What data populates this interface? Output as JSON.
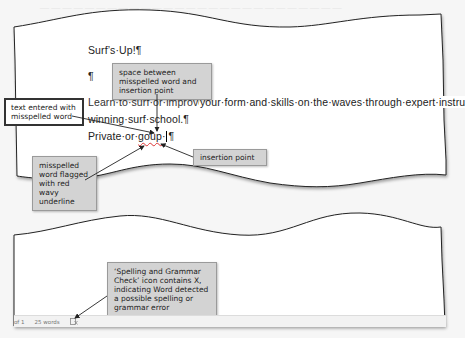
{
  "document": {
    "lines": [
      {
        "id": "title",
        "text": "Surf’s·Up!¶"
      },
      {
        "id": "blank",
        "text": "¶"
      },
      {
        "id": "para1_start",
        "text": "Learn·to·surf·or·improve·"
      },
      {
        "id": "para1_visible",
        "text": "your·form·and·skills·on·the·waves·through·expert·instru"
      },
      {
        "id": "para1_line2",
        "text": "winning·surf·school.¶"
      }
    ],
    "line4": {
      "prefix": "Private·or·",
      "misspelled_word": "goup",
      "after_space": "·",
      "pilcrow": "¶"
    },
    "misspelled_underline_color": "#d33333"
  },
  "status_bar": {
    "page_info": "of 1",
    "word_count": "25 words",
    "spell_icon": "spelling-grammar-check-icon-with-x"
  },
  "callouts": {
    "space_between": "space between misspelled word and insertion point",
    "text_entered": "text entered with misspelled word",
    "misspelled_flagged": "misspelled word flagged with red wavy underline",
    "insertion_point": "insertion point",
    "spelling_grammar": "‘Spelling and Grammar Check’ icon contains X, indicating Word detected a possible spelling or grammar error"
  },
  "colors": {
    "callout_bg": "#d3d3d3",
    "page_bg": "#ffffff",
    "background": "#f6f6f6"
  }
}
